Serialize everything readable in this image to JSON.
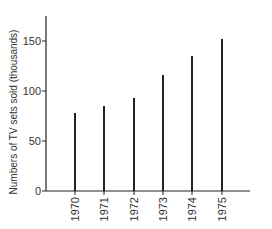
{
  "chart_data": {
    "type": "bar",
    "title": "",
    "xlabel": "",
    "ylabel": "Numbers of TV sets sold (thousands)",
    "categories": [
      "1970",
      "1971",
      "1972",
      "1973",
      "1974",
      "1975"
    ],
    "values": [
      78,
      85,
      93,
      116,
      135,
      152
    ],
    "ylim": [
      0,
      175
    ],
    "yticks": [
      0,
      50,
      100,
      150
    ],
    "ytick_labels": [
      "0",
      "50",
      "100",
      "150"
    ],
    "grid": false,
    "legend": null,
    "style": "stick bars (thin vertical lines), x tick labels rotated vertically"
  },
  "axis": {
    "ylabel": "Numbers of TV sets sold (thousands)"
  }
}
